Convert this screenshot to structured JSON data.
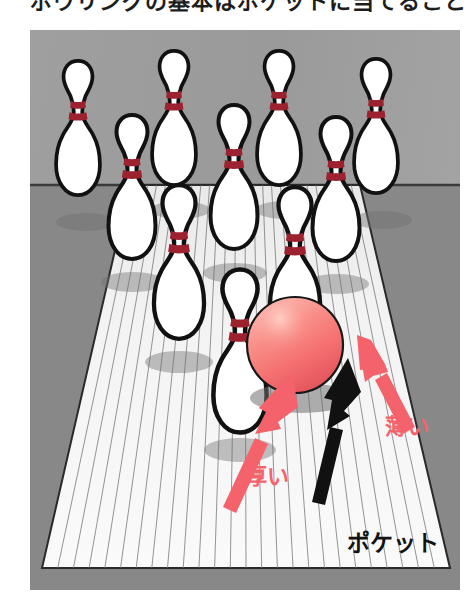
{
  "page": {
    "width": 473,
    "height": 602,
    "background": "#ffffff",
    "caption_clipped_text": "ボウリングの基本はポケットに当てること"
  },
  "illustration": {
    "title": "bowling-lane-pocket-diagram",
    "frame": {
      "x": 30,
      "y": 30,
      "width": 430,
      "height": 560
    },
    "colors": {
      "background_upper": "#9b9b9b",
      "background_lower": "#868686",
      "lane_surface": "#f2f2f2",
      "lane_board_line": "#6e6e6e",
      "pin_body": "#ffffff",
      "pin_outline": "#111111",
      "pin_stripe": "#9d2230",
      "ball_main": "#f4706f",
      "ball_highlight": "#f9a39b",
      "ball_shadow_edge": "#e04a52",
      "shadow": "#7d7d7d",
      "arrow_red": "#f4636b",
      "arrow_black": "#111111",
      "label_red": "#f4636b",
      "label_black": "#131313"
    },
    "lane": {
      "board_count": 26,
      "top_left_x": 100,
      "top_right_x": 330,
      "bottom_left_x": 12,
      "bottom_right_x": 420,
      "horizon_y": 155,
      "bottom_y": 538
    }
  },
  "pins": {
    "count": 10,
    "stripe_count_each": 2,
    "rows": [
      {
        "row": 1,
        "label": "head-pin-row",
        "pin_numbers": [
          1
        ]
      },
      {
        "row": 2,
        "label": "second-row",
        "pin_numbers": [
          2,
          3
        ]
      },
      {
        "row": 3,
        "label": "third-row",
        "pin_numbers": [
          4,
          5,
          6
        ]
      },
      {
        "row": 4,
        "label": "back-row",
        "pin_numbers": [
          7,
          8,
          9,
          10
        ]
      }
    ],
    "positions": [
      {
        "id": "pin-7",
        "cx": 48,
        "cy": 130,
        "scale": 1.0
      },
      {
        "id": "pin-8",
        "cx": 143,
        "cy": 118,
        "scale": 1.0
      },
      {
        "id": "pin-9",
        "cx": 248,
        "cy": 118,
        "scale": 1.0
      },
      {
        "id": "pin-10",
        "cx": 345,
        "cy": 128,
        "scale": 1.0
      },
      {
        "id": "pin-4",
        "cx": 93,
        "cy": 180,
        "scale": 1.06
      },
      {
        "id": "pin-5",
        "cx": 196,
        "cy": 172,
        "scale": 1.06
      },
      {
        "id": "pin-6",
        "cx": 298,
        "cy": 182,
        "scale": 1.06
      },
      {
        "id": "pin-2",
        "cx": 137,
        "cy": 250,
        "scale": 1.14
      },
      {
        "id": "pin-3",
        "cx": 253,
        "cy": 252,
        "scale": 1.14
      },
      {
        "id": "pin-1",
        "cx": 196,
        "cy": 322,
        "scale": 1.22
      }
    ]
  },
  "ball": {
    "name": "bowling-ball",
    "cx": 265,
    "cy": 315,
    "r": 48,
    "color": "#f4706f"
  },
  "arrows": [
    {
      "id": "arrow-atsui",
      "color": "#f4636b",
      "label": "厚い",
      "meaning": "thick",
      "from": {
        "x": 198,
        "y": 472
      },
      "to": {
        "x": 264,
        "y": 342
      }
    },
    {
      "id": "arrow-pocket",
      "color": "#111111",
      "label": "ポケット",
      "meaning": "pocket",
      "from": {
        "x": 288,
        "y": 468
      },
      "to": {
        "x": 320,
        "y": 330
      }
    },
    {
      "id": "arrow-usui",
      "color": "#f4636b",
      "label": "薄い",
      "meaning": "thin",
      "from": {
        "x": 380,
        "y": 400
      },
      "to": {
        "x": 328,
        "y": 332
      }
    }
  ],
  "labels": {
    "usui": "薄い",
    "atsui": "厚い",
    "pocket": "ポケット"
  }
}
